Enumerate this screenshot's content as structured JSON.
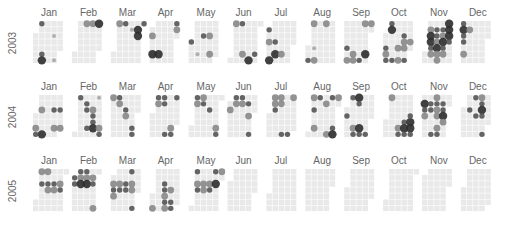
{
  "chart_data": {
    "type": "heatmap",
    "subtype": "calendar-bubble",
    "title": "",
    "years": [
      "2003",
      "2004",
      "2005"
    ],
    "months": [
      "Jan",
      "Feb",
      "Mar",
      "Apr",
      "May",
      "Jun",
      "Jul",
      "Aug",
      "Sep",
      "Oct",
      "Nov",
      "Dec"
    ],
    "layout": "rows = years; each month block: columns = weeks, rows = weekdays (Mon top)",
    "cell_color": "#e9e9e9",
    "dot_colors": {
      "1": "#a8a8a8",
      "2": "#888888",
      "3": "#555555",
      "4": "#2e2e2e"
    },
    "legend": "none",
    "points": [
      {
        "date": "2003-01-06",
        "v": 3
      },
      {
        "date": "2003-01-22",
        "v": 1
      },
      {
        "date": "2003-01-11",
        "v": 3
      },
      {
        "date": "2003-01-26",
        "v": 1
      },
      {
        "date": "2003-01-12",
        "v": 4
      },
      {
        "date": "2003-02-10",
        "v": 2
      },
      {
        "date": "2003-02-17",
        "v": 2
      },
      {
        "date": "2003-02-24",
        "v": 4
      },
      {
        "date": "2003-03-03",
        "v": 2
      },
      {
        "date": "2003-03-10",
        "v": 3
      },
      {
        "date": "2003-03-18",
        "v": 1
      },
      {
        "date": "2003-03-31",
        "v": 3
      },
      {
        "date": "2003-03-25",
        "v": 4
      },
      {
        "date": "2003-03-26",
        "v": 4
      },
      {
        "date": "2003-04-02",
        "v": 2
      },
      {
        "date": "2003-04-05",
        "v": 4
      },
      {
        "date": "2003-04-12",
        "v": 4
      },
      {
        "date": "2003-04-28",
        "v": 3
      },
      {
        "date": "2003-04-29",
        "v": 2
      },
      {
        "date": "2003-05-14",
        "v": 3
      },
      {
        "date": "2003-05-21",
        "v": 2
      },
      {
        "date": "2003-05-24",
        "v": 2
      },
      {
        "date": "2003-05-10",
        "v": 1
      },
      {
        "date": "2003-05-01",
        "v": 3
      },
      {
        "date": "2003-06-02",
        "v": 2
      },
      {
        "date": "2003-06-09",
        "v": 3
      },
      {
        "date": "2003-06-14",
        "v": 2
      },
      {
        "date": "2003-06-28",
        "v": 3
      },
      {
        "date": "2003-06-22",
        "v": 4
      },
      {
        "date": "2003-07-01",
        "v": 3
      },
      {
        "date": "2003-07-03",
        "v": 2
      },
      {
        "date": "2003-07-10",
        "v": 3
      },
      {
        "date": "2003-07-12",
        "v": 4
      },
      {
        "date": "2003-07-19",
        "v": 2
      },
      {
        "date": "2003-07-06",
        "v": 4
      },
      {
        "date": "2003-08-04",
        "v": 2
      },
      {
        "date": "2003-08-18",
        "v": 2
      },
      {
        "date": "2003-08-08",
        "v": 1
      },
      {
        "date": "2003-08-03",
        "v": 3
      },
      {
        "date": "2003-08-10",
        "v": 2
      },
      {
        "date": "2003-09-22",
        "v": 2
      },
      {
        "date": "2003-09-29",
        "v": 2
      },
      {
        "date": "2003-09-05",
        "v": 3
      },
      {
        "date": "2003-09-13",
        "v": 2
      },
      {
        "date": "2003-09-27",
        "v": 4
      },
      {
        "date": "2003-09-07",
        "v": 2
      },
      {
        "date": "2003-09-14",
        "v": 2
      },
      {
        "date": "2003-09-21",
        "v": 3
      },
      {
        "date": "2003-10-06",
        "v": 3
      },
      {
        "date": "2003-10-07",
        "v": 4
      },
      {
        "date": "2003-10-22",
        "v": 3
      },
      {
        "date": "2003-10-23",
        "v": 2
      },
      {
        "date": "2003-10-24",
        "v": 2
      },
      {
        "date": "2003-10-30",
        "v": 2
      },
      {
        "date": "2003-10-03",
        "v": 3
      },
      {
        "date": "2003-10-04",
        "v": 2
      },
      {
        "date": "2003-10-05",
        "v": 3
      },
      {
        "date": "2003-10-12",
        "v": 3
      },
      {
        "date": "2003-10-19",
        "v": 2
      },
      {
        "date": "2003-10-26",
        "v": 3
      },
      {
        "date": "2003-10-17",
        "v": 2
      },
      {
        "date": "2003-11-04",
        "v": 2
      },
      {
        "date": "2003-11-05",
        "v": 4
      },
      {
        "date": "2003-11-06",
        "v": 4
      },
      {
        "date": "2003-11-07",
        "v": 3
      },
      {
        "date": "2003-11-08",
        "v": 2
      },
      {
        "date": "2003-11-11",
        "v": 3
      },
      {
        "date": "2003-11-12",
        "v": 3
      },
      {
        "date": "2003-11-13",
        "v": 2
      },
      {
        "date": "2003-11-14",
        "v": 4
      },
      {
        "date": "2003-11-18",
        "v": 3
      },
      {
        "date": "2003-11-19",
        "v": 2
      },
      {
        "date": "2003-11-20",
        "v": 4
      },
      {
        "date": "2003-11-21",
        "v": 3
      },
      {
        "date": "2003-11-22",
        "v": 2
      },
      {
        "date": "2003-11-24",
        "v": 4
      },
      {
        "date": "2003-11-25",
        "v": 4
      },
      {
        "date": "2003-11-26",
        "v": 4
      },
      {
        "date": "2003-11-27",
        "v": 3
      },
      {
        "date": "2003-11-15",
        "v": 2
      },
      {
        "date": "2003-11-16",
        "v": 2
      },
      {
        "date": "2003-12-01",
        "v": 3
      },
      {
        "date": "2003-12-02",
        "v": 4
      },
      {
        "date": "2003-12-03",
        "v": 3
      },
      {
        "date": "2003-12-04",
        "v": 3
      },
      {
        "date": "2003-12-06",
        "v": 2
      },
      {
        "date": "2003-12-09",
        "v": 2
      },
      {
        "date": "2004-01-07",
        "v": 2
      },
      {
        "date": "2004-01-21",
        "v": 3
      },
      {
        "date": "2004-01-24",
        "v": 2
      },
      {
        "date": "2004-01-03",
        "v": 2
      },
      {
        "date": "2004-01-28",
        "v": 3
      },
      {
        "date": "2004-01-31",
        "v": 2
      },
      {
        "date": "2004-01-11",
        "v": 4
      },
      {
        "date": "2004-01-04",
        "v": 3
      },
      {
        "date": "2004-02-02",
        "v": 3
      },
      {
        "date": "2004-02-10",
        "v": 3
      },
      {
        "date": "2004-02-11",
        "v": 3
      },
      {
        "date": "2004-02-18",
        "v": 2
      },
      {
        "date": "2004-02-19",
        "v": 3
      },
      {
        "date": "2004-02-20",
        "v": 3
      },
      {
        "date": "2004-02-21",
        "v": 4
      },
      {
        "date": "2004-02-28",
        "v": 2
      },
      {
        "date": "2004-02-29",
        "v": 3
      },
      {
        "date": "2004-02-23",
        "v": 1
      },
      {
        "date": "2004-02-14",
        "v": 3
      },
      {
        "date": "2004-03-01",
        "v": 2
      },
      {
        "date": "2004-03-09",
        "v": 2
      },
      {
        "date": "2004-03-17",
        "v": 3
      },
      {
        "date": "2004-03-18",
        "v": 2
      },
      {
        "date": "2004-03-27",
        "v": 3
      },
      {
        "date": "2004-03-28",
        "v": 3
      },
      {
        "date": "2004-03-08",
        "v": 3
      },
      {
        "date": "2004-04-05",
        "v": 3
      },
      {
        "date": "2004-04-06",
        "v": 2
      },
      {
        "date": "2004-04-12",
        "v": 3
      },
      {
        "date": "2004-04-13",
        "v": 3
      },
      {
        "date": "2004-04-26",
        "v": 3
      },
      {
        "date": "2004-04-24",
        "v": 2
      },
      {
        "date": "2004-04-25",
        "v": 3
      },
      {
        "date": "2004-04-18",
        "v": 3
      },
      {
        "date": "2004-05-03",
        "v": 3
      },
      {
        "date": "2004-05-04",
        "v": 2
      },
      {
        "date": "2004-05-10",
        "v": 2
      },
      {
        "date": "2004-05-11",
        "v": 3
      },
      {
        "date": "2004-05-19",
        "v": 3
      },
      {
        "date": "2004-05-29",
        "v": 2
      },
      {
        "date": "2004-05-30",
        "v": 3
      },
      {
        "date": "2004-06-07",
        "v": 3
      },
      {
        "date": "2004-06-08",
        "v": 2
      },
      {
        "date": "2004-06-14",
        "v": 3
      },
      {
        "date": "2004-06-15",
        "v": 2
      },
      {
        "date": "2004-06-02",
        "v": 2
      },
      {
        "date": "2004-06-27",
        "v": 3
      },
      {
        "date": "2004-06-22",
        "v": 3
      },
      {
        "date": "2004-06-24",
        "v": 2
      },
      {
        "date": "2004-07-05",
        "v": 2
      },
      {
        "date": "2004-07-06",
        "v": 2
      },
      {
        "date": "2004-07-07",
        "v": 3
      },
      {
        "date": "2004-07-12",
        "v": 2
      },
      {
        "date": "2004-07-13",
        "v": 2
      },
      {
        "date": "2004-07-18",
        "v": 3
      },
      {
        "date": "2004-07-25",
        "v": 3
      },
      {
        "date": "2004-07-26",
        "v": 2
      },
      {
        "date": "2004-08-02",
        "v": 2
      },
      {
        "date": "2004-08-09",
        "v": 3
      },
      {
        "date": "2004-08-17",
        "v": 2
      },
      {
        "date": "2004-08-04",
        "v": 3
      },
      {
        "date": "2004-08-07",
        "v": 2
      },
      {
        "date": "2004-08-22",
        "v": 2
      },
      {
        "date": "2004-08-28",
        "v": 3
      },
      {
        "date": "2004-08-29",
        "v": 4
      },
      {
        "date": "2004-08-30",
        "v": 2
      },
      {
        "date": "2004-08-23",
        "v": 3
      },
      {
        "date": "2004-09-06",
        "v": 3
      },
      {
        "date": "2004-09-13",
        "v": 4
      },
      {
        "date": "2004-09-14",
        "v": 3
      },
      {
        "date": "2004-09-11",
        "v": 2
      },
      {
        "date": "2004-09-12",
        "v": 3
      },
      {
        "date": "2004-09-18",
        "v": 4
      },
      {
        "date": "2004-09-19",
        "v": 3
      },
      {
        "date": "2004-09-26",
        "v": 3
      },
      {
        "date": "2004-09-02",
        "v": 3
      },
      {
        "date": "2004-10-04",
        "v": 2
      },
      {
        "date": "2004-10-16",
        "v": 2
      },
      {
        "date": "2004-10-17",
        "v": 3
      },
      {
        "date": "2004-10-22",
        "v": 3
      },
      {
        "date": "2004-10-23",
        "v": 4
      },
      {
        "date": "2004-10-24",
        "v": 3
      },
      {
        "date": "2004-10-29",
        "v": 4
      },
      {
        "date": "2004-10-30",
        "v": 4
      },
      {
        "date": "2004-10-31",
        "v": 3
      },
      {
        "date": "2004-10-28",
        "v": 3
      },
      {
        "date": "2004-11-02",
        "v": 4
      },
      {
        "date": "2004-11-03",
        "v": 3
      },
      {
        "date": "2004-11-04",
        "v": 2
      },
      {
        "date": "2004-11-09",
        "v": 3
      },
      {
        "date": "2004-11-10",
        "v": 3
      },
      {
        "date": "2004-11-16",
        "v": 3
      },
      {
        "date": "2004-11-17",
        "v": 2
      },
      {
        "date": "2004-11-18",
        "v": 2
      },
      {
        "date": "2004-11-23",
        "v": 3
      },
      {
        "date": "2004-11-24",
        "v": 3
      },
      {
        "date": "2004-11-25",
        "v": 4
      },
      {
        "date": "2004-11-26",
        "v": 2
      },
      {
        "date": "2004-11-20",
        "v": 2
      },
      {
        "date": "2004-11-21",
        "v": 3
      },
      {
        "date": "2004-11-14",
        "v": 3
      },
      {
        "date": "2004-11-15",
        "v": 2
      },
      {
        "date": "2004-12-08",
        "v": 3
      },
      {
        "date": "2004-12-13",
        "v": 3
      },
      {
        "date": "2004-12-16",
        "v": 3
      },
      {
        "date": "2004-12-20",
        "v": 2
      },
      {
        "date": "2004-12-21",
        "v": 3
      },
      {
        "date": "2004-12-22",
        "v": 4
      },
      {
        "date": "2004-12-23",
        "v": 3
      },
      {
        "date": "2004-12-26",
        "v": 3
      },
      {
        "date": "2005-01-05",
        "v": 3
      },
      {
        "date": "2005-01-12",
        "v": 3
      },
      {
        "date": "2005-01-13",
        "v": 2
      },
      {
        "date": "2005-01-19",
        "v": 3
      },
      {
        "date": "2005-01-20",
        "v": 2
      },
      {
        "date": "2005-01-26",
        "v": 2
      },
      {
        "date": "2005-01-27",
        "v": 3
      },
      {
        "date": "2005-01-03",
        "v": 2
      },
      {
        "date": "2005-01-10",
        "v": 2
      },
      {
        "date": "2005-02-01",
        "v": 3
      },
      {
        "date": "2005-02-02",
        "v": 3
      },
      {
        "date": "2005-02-07",
        "v": 3
      },
      {
        "date": "2005-02-08",
        "v": 2
      },
      {
        "date": "2005-02-09",
        "v": 4
      },
      {
        "date": "2005-02-14",
        "v": 3
      },
      {
        "date": "2005-02-15",
        "v": 2
      },
      {
        "date": "2005-02-16",
        "v": 4
      },
      {
        "date": "2005-02-22",
        "v": 2
      },
      {
        "date": "2005-02-23",
        "v": 3
      },
      {
        "date": "2005-02-27",
        "v": 2
      },
      {
        "date": "2005-03-02",
        "v": 2
      },
      {
        "date": "2005-03-03",
        "v": 3
      },
      {
        "date": "2005-03-04",
        "v": 2
      },
      {
        "date": "2005-03-09",
        "v": 2
      },
      {
        "date": "2005-03-10",
        "v": 3
      },
      {
        "date": "2005-03-16",
        "v": 3
      },
      {
        "date": "2005-03-17",
        "v": 3
      },
      {
        "date": "2005-03-23",
        "v": 2
      },
      {
        "date": "2005-03-24",
        "v": 2
      },
      {
        "date": "2005-03-21",
        "v": 3
      },
      {
        "date": "2005-03-27",
        "v": 3
      },
      {
        "date": "2005-04-03",
        "v": 2
      },
      {
        "date": "2005-04-13",
        "v": 3
      },
      {
        "date": "2005-04-14",
        "v": 3
      },
      {
        "date": "2005-04-15",
        "v": 2
      },
      {
        "date": "2005-04-16",
        "v": 3
      },
      {
        "date": "2005-04-17",
        "v": 2
      },
      {
        "date": "2005-04-21",
        "v": 2
      },
      {
        "date": "2005-04-23",
        "v": 3
      },
      {
        "date": "2005-04-24",
        "v": 3
      },
      {
        "date": "2005-05-02",
        "v": 3
      },
      {
        "date": "2005-05-04",
        "v": 2
      },
      {
        "date": "2005-05-05",
        "v": 3
      },
      {
        "date": "2005-05-11",
        "v": 2
      },
      {
        "date": "2005-05-12",
        "v": 2
      },
      {
        "date": "2005-05-18",
        "v": 2
      },
      {
        "date": "2005-05-19",
        "v": 3
      },
      {
        "date": "2005-05-23",
        "v": 3
      },
      {
        "date": "2005-05-25",
        "v": 4
      },
      {
        "date": "2005-05-30",
        "v": 2
      }
    ],
    "data_end": "2005-05-31"
  }
}
